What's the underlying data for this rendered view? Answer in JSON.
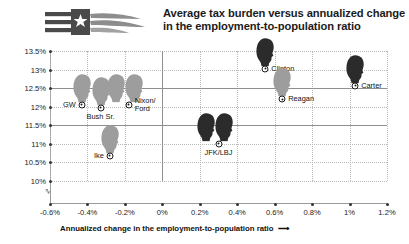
{
  "header": {
    "logo_name": "flag-swoosh-logo",
    "title_line1": "Average tax burden versus annualized change",
    "title_line2": "in the employment-to-population ratio"
  },
  "chart_data": {
    "type": "scatter",
    "title": "Average tax burden versus annualized change in the employment-to-population ratio",
    "xlabel": "Annualized change in the employment-to-population ratio",
    "ylabel": "Average tax burden",
    "xlim": [
      -0.6,
      1.2
    ],
    "ylim": [
      9.75,
      13.5
    ],
    "xticks": [
      "-0.6%",
      "-0.4%",
      "-0.2%",
      "0%",
      "0.2%",
      "0.4%",
      "0.6%",
      "0.8%",
      "1%",
      "1.2%"
    ],
    "xtick_values": [
      -0.6,
      -0.4,
      -0.2,
      0,
      0.2,
      0.4,
      0.6,
      0.8,
      1.0,
      1.2
    ],
    "yticks": [
      "13.5%",
      "13%",
      "12.5%",
      "12%",
      "11.5%",
      "11%",
      "10.5%",
      "10%"
    ],
    "ytick_values": [
      13.5,
      13,
      12.5,
      12,
      11.5,
      11,
      10.5,
      10
    ],
    "grid": true,
    "axis_break": true,
    "legend": "none",
    "points": [
      {
        "label": "GW",
        "x": -0.43,
        "y": 12.05,
        "label_pos": "left",
        "head_shade": "light",
        "heads": 1
      },
      {
        "label": "Bush Sr.",
        "x": -0.33,
        "y": 11.97,
        "label_pos": "below",
        "head_shade": "light",
        "heads": 1
      },
      {
        "label": "Nixon/\nFord",
        "x": -0.18,
        "y": 12.05,
        "label_pos": "right",
        "head_shade": "light",
        "heads": 2
      },
      {
        "label": "Ike",
        "x": -0.28,
        "y": 10.68,
        "label_pos": "left",
        "head_shade": "light",
        "heads": 1
      },
      {
        "label": "JFK/LBJ",
        "x": 0.3,
        "y": 11.0,
        "label_pos": "below",
        "head_shade": "dark",
        "heads": 2
      },
      {
        "label": "Clinton",
        "x": 0.55,
        "y": 13.02,
        "label_pos": "right",
        "head_shade": "dark",
        "heads": 1
      },
      {
        "label": "Reagan",
        "x": 0.64,
        "y": 12.2,
        "label_pos": "right",
        "head_shade": "light",
        "heads": 1
      },
      {
        "label": "Carter",
        "x": 1.03,
        "y": 12.57,
        "label_pos": "right",
        "head_shade": "dark",
        "heads": 1
      }
    ]
  }
}
